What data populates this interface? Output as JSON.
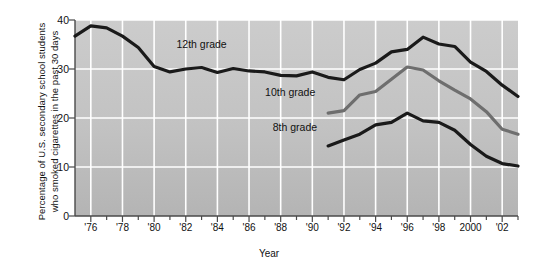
{
  "chart_data": {
    "type": "line",
    "title": "",
    "xlabel": "Year",
    "ylabel": "Percentage of U.S. secondary school students\nwho smoked cigarettes in the past 30 days",
    "xlim": [
      1975,
      2003
    ],
    "ylim": [
      0,
      40
    ],
    "yticks": [
      0,
      10,
      20,
      30,
      40
    ],
    "ytick_labels": [
      "0",
      "10",
      "20",
      "30",
      "40"
    ],
    "xticks": [
      1976,
      1978,
      1980,
      1982,
      1984,
      1986,
      1988,
      1990,
      1992,
      1994,
      1996,
      1998,
      2000,
      2002
    ],
    "xtick_labels": [
      "'76",
      "'78",
      "'80",
      "'82",
      "'84",
      "'86",
      "'88",
      "'90",
      "'92",
      "'94",
      "'96",
      "'98",
      "2000",
      "'02"
    ],
    "minor_xticks_every": 1,
    "grid": "white gridlines, horizontal at every 10 and vertical at every 2 years",
    "legend_position": "inline annotations on plot",
    "plot_background": "#c2c2c2",
    "gridline_color": "#ffffff",
    "series": [
      {
        "name": "12th grade",
        "color": "#1a1a1a",
        "label_x": 1983.0,
        "label_y": 34.3,
        "x": [
          1975,
          1976,
          1977,
          1978,
          1979,
          1980,
          1981,
          1982,
          1983,
          1984,
          1985,
          1986,
          1987,
          1988,
          1989,
          1990,
          1991,
          1992,
          1993,
          1994,
          1995,
          1996,
          1997,
          1998,
          1999,
          2000,
          2001,
          2002,
          2003
        ],
        "values": [
          36.7,
          38.8,
          38.4,
          36.7,
          34.4,
          30.5,
          29.4,
          30.0,
          30.3,
          29.3,
          30.1,
          29.6,
          29.4,
          28.7,
          28.6,
          29.4,
          28.3,
          27.8,
          29.9,
          31.2,
          33.5,
          34.0,
          36.5,
          35.1,
          34.6,
          31.4,
          29.5,
          26.7,
          24.4
        ]
      },
      {
        "name": "10th grade",
        "color": "#6e6e6e",
        "label_x": 1988.6,
        "label_y": 24.4,
        "x": [
          1991,
          1992,
          1993,
          1994,
          1995,
          1996,
          1997,
          1998,
          1999,
          2000,
          2001,
          2002,
          2003
        ],
        "values": [
          21.0,
          21.5,
          24.7,
          25.4,
          27.9,
          30.4,
          29.8,
          27.6,
          25.7,
          23.9,
          21.3,
          17.7,
          16.7
        ]
      },
      {
        "name": "8th grade",
        "color": "#1a1a1a",
        "label_x": 1988.9,
        "label_y": 17.3,
        "x": [
          1991,
          1992,
          1993,
          1994,
          1995,
          1996,
          1997,
          1998,
          1999,
          2000,
          2001,
          2002,
          2003
        ],
        "values": [
          14.3,
          15.5,
          16.7,
          18.6,
          19.1,
          21.0,
          19.4,
          19.1,
          17.5,
          14.6,
          12.2,
          10.7,
          10.2
        ]
      }
    ]
  },
  "axis": {
    "x_title": "Year",
    "y_title_line1": "Percentage of U.S. secondary school students",
    "y_title_line2": "who smoked cigarettes in the past 30 days"
  }
}
